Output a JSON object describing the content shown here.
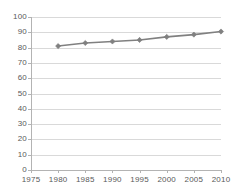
{
  "chart_data": {
    "type": "line",
    "title": "",
    "subtitle": "",
    "xlabel": "",
    "ylabel": "",
    "x": [
      1980,
      1985,
      1990,
      1995,
      2000,
      2005,
      2010
    ],
    "series": [
      {
        "name": "",
        "values": [
          81,
          83,
          84,
          85,
          87,
          88.5,
          90.5
        ],
        "color": "#808080",
        "marker": "diamond",
        "marker_color": "#808080",
        "line_width": 1.6
      }
    ],
    "xlim": [
      1975,
      2010
    ],
    "ylim": [
      0,
      100
    ],
    "x_ticks": [
      1975,
      1980,
      1985,
      1990,
      1995,
      2000,
      2005,
      2010
    ],
    "x_tick_labels": [
      "1975",
      "1980",
      "1985",
      "1990",
      "1995",
      "2000",
      "2005",
      "2010"
    ],
    "y_ticks": [
      0,
      10,
      20,
      30,
      40,
      50,
      60,
      70,
      80,
      90,
      100
    ],
    "y_tick_labels": [
      "0",
      "10",
      "20",
      "30",
      "40",
      "50",
      "60",
      "70",
      "80",
      "90",
      "100"
    ],
    "grid": {
      "horizontal": true,
      "vertical": false,
      "color": "#d9d9d9"
    },
    "legend": {
      "visible": false,
      "position": "none",
      "entries": []
    },
    "annotations": [],
    "axis_color": "#b3b3b3",
    "tick_label_color": "#595959",
    "background_color": "#ffffff"
  }
}
